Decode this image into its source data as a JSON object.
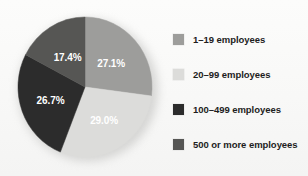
{
  "chart_data": {
    "type": "pie",
    "title": "",
    "subtitle": "",
    "xlabel": "",
    "ylabel": "",
    "legend_position": "right",
    "grid": false,
    "start_angle_deg": 0,
    "direction": "clockwise",
    "categories": [
      "1–19 employees",
      "20–99 employees",
      "100–499 employees",
      "500 or more employees"
    ],
    "values": [
      27.1,
      29.0,
      26.7,
      17.4
    ],
    "value_unit": "%",
    "data_labels": [
      "27.1%",
      "29.0%",
      "26.7%",
      "17.4%"
    ],
    "colors": [
      "#9d9d9b",
      "#dcdcda",
      "#2c2c2c",
      "#565654"
    ],
    "label_text_colors": [
      "#ffffff",
      "#ffffff",
      "#ffffff",
      "#ffffff"
    ],
    "slices": [
      {
        "label": "1–19 employees",
        "value": 27.1,
        "data_label": "27.1%",
        "color": "#9d9d9b"
      },
      {
        "label": "20–99 employees",
        "value": 29.0,
        "data_label": "29.0%",
        "color": "#dcdcda"
      },
      {
        "label": "100–499 employees",
        "value": 26.7,
        "data_label": "26.7%",
        "color": "#2c2c2c"
      },
      {
        "label": "500 or more employees",
        "value": 17.4,
        "data_label": "17.4%",
        "color": "#565654"
      }
    ]
  },
  "legend": {
    "items": [
      {
        "label": "1–19 employees",
        "color": "#9d9d9b"
      },
      {
        "label": "20–99 employees",
        "color": "#dcdcda"
      },
      {
        "label": "100–499 employees",
        "color": "#2c2c2c"
      },
      {
        "label": "500 or more employees",
        "color": "#565654"
      }
    ]
  }
}
